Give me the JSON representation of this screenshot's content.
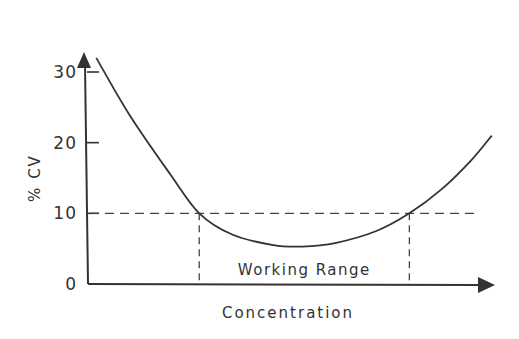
{
  "chart_data": {
    "type": "line",
    "title": "",
    "xlabel": "Concentration",
    "ylabel": "% CV",
    "ylim": [
      0,
      33
    ],
    "xlim": [
      0,
      1
    ],
    "yticks": [
      0,
      10,
      20,
      30
    ],
    "ytick_labels": [
      "0",
      "10",
      "20",
      "30"
    ],
    "grid": false,
    "series": [
      {
        "name": "precision profile",
        "x": [
          0.02,
          0.1,
          0.2,
          0.27,
          0.35,
          0.45,
          0.52,
          0.6,
          0.7,
          0.78,
          0.86,
          0.93,
          0.98
        ],
        "y": [
          32,
          24,
          15.5,
          10,
          7,
          5.5,
          5.3,
          5.8,
          7.5,
          10,
          13.5,
          17.5,
          21
        ]
      }
    ],
    "reference_line": {
      "y": 10,
      "style": "dashed"
    },
    "working_range": {
      "x_start": 0.27,
      "x_end": 0.78,
      "label": "Working Range"
    },
    "color": "#333333"
  }
}
